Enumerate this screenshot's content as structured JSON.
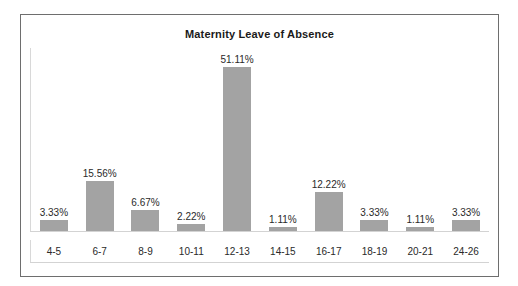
{
  "chart": {
    "title": "Maternity Leave of Absence",
    "frame_color": "#6e6e6e",
    "bar_color": "#a3a3a3",
    "axis_color": "#d3d3d3",
    "text_color": "#2a2a2a"
  },
  "chart_data": {
    "type": "bar",
    "title": "Maternity Leave of Absence",
    "subtitle": "",
    "xlabel": "",
    "ylabel": "",
    "grid": false,
    "legend": false,
    "ylim": [
      0,
      57
    ],
    "value_suffix": "%",
    "categories": [
      "4-5",
      "6-7",
      "8-9",
      "10-11",
      "12-13",
      "14-15",
      "16-17",
      "18-19",
      "20-21",
      "24-26"
    ],
    "values": [
      3.33,
      15.56,
      6.67,
      2.22,
      51.11,
      1.11,
      12.22,
      3.33,
      1.11,
      3.33
    ],
    "data_labels": [
      "3.33%",
      "15.56%",
      "6.67%",
      "2.22%",
      "51.11%",
      "1.11%",
      "12.22%",
      "3.33%",
      "1.11%",
      "3.33%"
    ],
    "series": [
      {
        "name": "Maternity Leave of Absence",
        "values": [
          3.33,
          15.56,
          6.67,
          2.22,
          51.11,
          1.11,
          12.22,
          3.33,
          1.11,
          3.33
        ]
      }
    ]
  }
}
